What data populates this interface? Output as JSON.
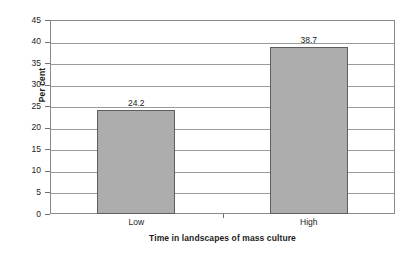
{
  "chart_data": {
    "type": "bar",
    "title": "",
    "subtitle": "",
    "categories": [
      "Low",
      "High"
    ],
    "values": [
      24.2,
      38.7
    ],
    "data_labels": [
      "24.2",
      "38.7"
    ],
    "xlabel": "Time in landscapes of mass culture",
    "ylabel": "Per cent",
    "ylim": [
      0,
      45
    ],
    "ytick_interval": 5,
    "yticks": [
      0,
      5,
      10,
      15,
      20,
      25,
      30,
      35,
      40,
      45
    ],
    "ytick_labels": [
      "0",
      "5",
      "10",
      "15",
      "20",
      "25",
      "30",
      "35",
      "40",
      "45"
    ],
    "grid": {
      "horizontal": true,
      "vertical": false
    },
    "legend": {
      "visible": false,
      "position": "none"
    },
    "series": [
      {
        "name": "Per cent",
        "values": [
          24.2,
          38.7
        ]
      }
    ],
    "colors": {
      "bar_fill": "#adadad",
      "bar_border": "#5e5e5e",
      "gridline": "#9a9a9a",
      "axis": "#8a8a8a",
      "text": "#1c1c1c",
      "background": "#ffffff"
    }
  }
}
